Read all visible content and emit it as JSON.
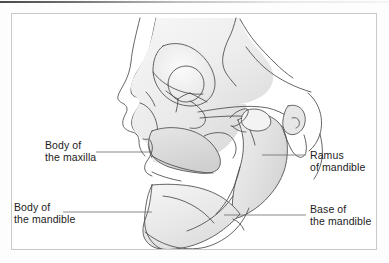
{
  "figure": {
    "name": "lateral-skull-jaw-anatomy",
    "background_color": "#ffffff",
    "frame_color": "#c9c9c9",
    "line_color": "#3f3f3f",
    "bone_fill_light": "#f2f2f2",
    "bone_fill_mid": "#e4e4e4",
    "bone_fill_shadow": "#d2d2d2",
    "text_color": "#1b1b1b"
  },
  "labels": {
    "body_of_maxilla": {
      "line1": "Body of",
      "line2": "the maxilla",
      "leader_from_x": 96,
      "leader_to_x": 152,
      "leader_y": 152
    },
    "body_of_mandible": {
      "line1": "Body of",
      "line2": "the mandible",
      "leader_from_x": 63,
      "leader_to_x": 152,
      "leader_y": 212
    },
    "ramus_of_mandible": {
      "line1": "Ramus",
      "line2": "of mandible",
      "leader_from_x": 262,
      "leader_to_x": 306,
      "leader_y": 155
    },
    "base_of_mandible": {
      "line1": "Base of",
      "line2": "the mandible",
      "leader_from_x": 224,
      "leader_to_x": 306,
      "leader_y": 215
    }
  },
  "anatomy_parts": [
    "cranium",
    "frontal-bone",
    "orbit",
    "zygomatic-bone",
    "zygomatic-arch",
    "nasal-aperture",
    "maxilla",
    "mandible-body",
    "mandible-ramus",
    "mandible-condyle",
    "coronoid-process",
    "mastoid-process",
    "external-acoustic-meatus"
  ]
}
